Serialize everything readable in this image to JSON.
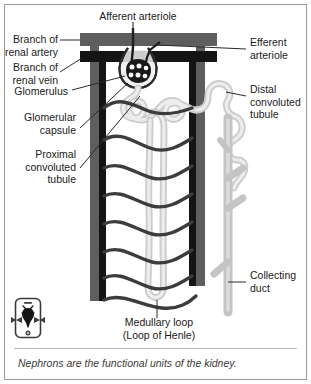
{
  "figure": {
    "caption": "Nephrons are the functional units of the kidney.",
    "background_color": "#ffffff",
    "border_color": "#9b9b9b"
  },
  "colors": {
    "artery": "#5e5e5e",
    "vein": "#1a1a1a",
    "capillary": "#4a4a4a",
    "tubule": "#c9c9c9",
    "tubule_core": "#e8e8e8",
    "collecting_duct": "#bdbdbd",
    "leader_line": "#2b2b2b",
    "text": "#1a1a1a",
    "caption_text": "#3a3a3a"
  },
  "labels": {
    "afferent_arteriole": "Afferent arteriole",
    "branch_of_renal_artery": "Branch of\nrenal artery",
    "branch_of_renal_vein": "Branch of\nrenal vein",
    "glomerulus": "Glomerulus",
    "glomerular_capsule": "Glomerular\ncapsule",
    "proximal_convoluted_tubule": "Proximal\nconvoluted\ntubule",
    "efferent_arteriole": "Efferent\narteriole",
    "distal_convoluted_tubule": "Distal\nconvoluted\ntubule",
    "collecting_duct": "Collecting\nduct",
    "medullary_loop": "Medullary loop\n(Loop of Henle)"
  },
  "icon": {
    "name": "kidney-organ-icon",
    "description": "rounded device outline containing a dark organ silhouette with side arrows"
  }
}
